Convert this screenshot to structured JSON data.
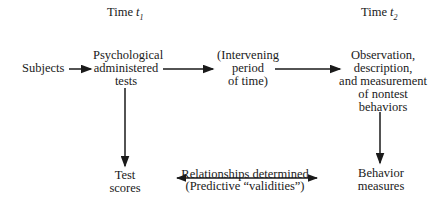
{
  "headers": {
    "time1": {
      "label": "Time",
      "var": "t",
      "sub": "1"
    },
    "time2": {
      "label": "Time",
      "var": "t",
      "sub": "2"
    }
  },
  "nodes": {
    "subjects": "Subjects",
    "tests": [
      "Psychological",
      "administered",
      "tests"
    ],
    "intervening": [
      "(Intervening",
      "period",
      "of time)"
    ],
    "observation": [
      "Observation,",
      "description,",
      "and measurement",
      "of nontest",
      "behaviors"
    ],
    "test_scores": [
      "Test",
      "scores"
    ],
    "behavior_measures": [
      "Behavior",
      "measures"
    ],
    "relationship": [
      "Relationships determined",
      "(Predictive “validities”)"
    ]
  },
  "colors": {
    "ink": "#1a1a1a",
    "background": "#ffffff"
  }
}
